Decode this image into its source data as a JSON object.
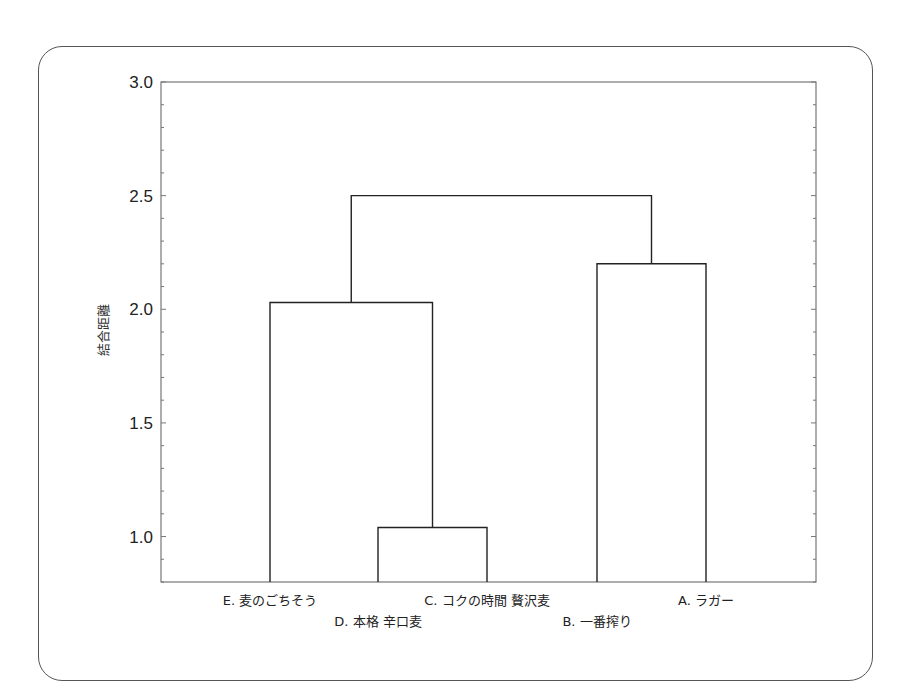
{
  "chart_data": {
    "type": "dendrogram",
    "title": "",
    "xlabel": "",
    "ylabel": "結合距離",
    "ylim": [
      0.8,
      3.0
    ],
    "yticks": [
      1.0,
      1.5,
      2.0,
      2.5,
      3.0
    ],
    "ytick_labels": [
      "1.0",
      "1.5",
      "2.0",
      "2.5",
      "3.0"
    ],
    "leaves": [
      {
        "id": "E",
        "label": "E. 麦のごちそう",
        "row": 0
      },
      {
        "id": "D",
        "label": "D. 本格 辛口麦",
        "row": 1
      },
      {
        "id": "C",
        "label": "C. コクの時間 贅沢麦",
        "row": 0
      },
      {
        "id": "B",
        "label": "B. 一番搾り",
        "row": 1
      },
      {
        "id": "A",
        "label": "A. ラガー",
        "row": 0
      }
    ],
    "merges": [
      {
        "left": "D",
        "right": "C",
        "height": 1.04
      },
      {
        "left": "E",
        "right": "DC",
        "height": 2.03
      },
      {
        "left": "B",
        "right": "A",
        "height": 2.2
      },
      {
        "left": "EDC",
        "right": "BA",
        "height": 2.5
      }
    ],
    "grid": false,
    "legend": null
  },
  "labels": {
    "ylabel": "結合距離",
    "yticks": [
      "1.0",
      "1.5",
      "2.0",
      "2.5",
      "3.0"
    ],
    "leaves": [
      "E. 麦のごちそう",
      "D. 本格 辛口麦",
      "C. コクの時間 贅沢麦",
      "B. 一番搾り",
      "A. ラガー"
    ]
  }
}
